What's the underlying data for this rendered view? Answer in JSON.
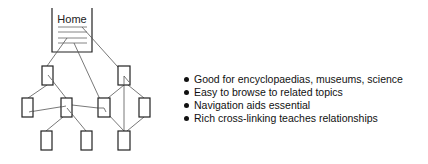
{
  "diagram": {
    "home_label": "Home",
    "stroke_color": "#222222",
    "link_color": "#555555",
    "nodes": [
      {
        "id": "n1",
        "x": 42,
        "y": 66,
        "w": 11,
        "h": 19
      },
      {
        "id": "n2",
        "x": 118,
        "y": 66,
        "w": 12,
        "h": 19
      },
      {
        "id": "n3",
        "x": 22,
        "y": 98,
        "w": 11,
        "h": 19
      },
      {
        "id": "n4",
        "x": 61,
        "y": 98,
        "w": 11,
        "h": 19
      },
      {
        "id": "n5",
        "x": 98,
        "y": 98,
        "w": 12,
        "h": 19
      },
      {
        "id": "n6",
        "x": 139,
        "y": 98,
        "w": 11,
        "h": 19
      },
      {
        "id": "n7",
        "x": 41,
        "y": 131,
        "w": 11,
        "h": 19
      },
      {
        "id": "n8",
        "x": 81,
        "y": 131,
        "w": 11,
        "h": 19
      },
      {
        "id": "n9",
        "x": 118,
        "y": 131,
        "w": 12,
        "h": 19
      }
    ]
  },
  "bullets": [
    "Good for encyclopaedias, museums, science",
    "Easy to browse to related topics",
    "Navigation aids essential",
    "Rich cross-linking teaches relationships"
  ]
}
